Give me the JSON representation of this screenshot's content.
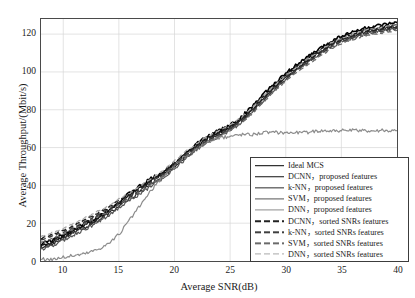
{
  "chart_data": {
    "type": "line",
    "title": "",
    "xlabel": "Average SNR(dB)",
    "ylabel": "Average Throughput/(Mbit/s)",
    "xlim": [
      8,
      40
    ],
    "ylim": [
      0,
      128
    ],
    "xticks": [
      10,
      15,
      20,
      25,
      30,
      35,
      40
    ],
    "yticks": [
      0,
      20,
      40,
      60,
      80,
      100,
      120
    ],
    "grid": true,
    "legend_position": "lower-right",
    "series": [
      {
        "name": "Ideal MCS",
        "style": "solid",
        "color": "#000000",
        "width": 1.6,
        "x": [
          8,
          9,
          10,
          11,
          12,
          13,
          14,
          15,
          16,
          17,
          18,
          19,
          20,
          21,
          22,
          23,
          24,
          25,
          26,
          27,
          28,
          29,
          30,
          31,
          32,
          33,
          34,
          35,
          36,
          37,
          38,
          39,
          40
        ],
        "values": [
          9,
          11,
          14,
          17,
          20,
          23,
          27,
          31,
          36,
          40,
          44,
          47,
          52,
          57,
          62,
          66,
          69,
          72,
          76,
          82,
          88,
          94,
          99,
          104,
          108,
          112,
          116,
          119,
          121,
          123,
          124,
          125,
          126
        ]
      },
      {
        "name": "DCNN，proposed features",
        "style": "solid",
        "color": "#111111",
        "width": 1.5,
        "x": [
          8,
          9,
          10,
          11,
          12,
          13,
          14,
          15,
          16,
          17,
          18,
          19,
          20,
          21,
          22,
          23,
          24,
          25,
          26,
          27,
          28,
          29,
          30,
          31,
          32,
          33,
          34,
          35,
          36,
          37,
          38,
          39,
          40
        ],
        "values": [
          8,
          10,
          13,
          16,
          19,
          22,
          26,
          30,
          35,
          39,
          43,
          46,
          51,
          56,
          61,
          65,
          68,
          71,
          75,
          81,
          87,
          93,
          98,
          103,
          107,
          111,
          115,
          118,
          120,
          122,
          123,
          124,
          125
        ]
      },
      {
        "name": "k-NN，proposed features",
        "style": "solid",
        "color": "#2b2b2b",
        "width": 1.3,
        "x": [
          8,
          9,
          10,
          11,
          12,
          13,
          14,
          15,
          16,
          17,
          18,
          19,
          20,
          21,
          22,
          23,
          24,
          25,
          26,
          27,
          28,
          29,
          30,
          31,
          32,
          33,
          34,
          35,
          36,
          37,
          38,
          39,
          40
        ],
        "values": [
          7,
          9,
          12,
          15,
          18,
          21,
          25,
          29,
          33,
          37,
          41,
          45,
          50,
          55,
          60,
          64,
          67,
          70,
          74,
          80,
          86,
          92,
          97,
          102,
          106,
          110,
          114,
          117,
          119,
          121,
          122,
          123,
          124
        ]
      },
      {
        "name": "SVM，proposed features",
        "style": "solid",
        "color": "#555555",
        "width": 1.2,
        "x": [
          8,
          9,
          10,
          11,
          12,
          13,
          14,
          15,
          16,
          17,
          18,
          19,
          20,
          21,
          22,
          23,
          24,
          25,
          26,
          27,
          28,
          29,
          30,
          31,
          32,
          33,
          34,
          35,
          36,
          37,
          38,
          39,
          40
        ],
        "values": [
          6,
          8,
          11,
          14,
          17,
          20,
          24,
          28,
          32,
          36,
          40,
          44,
          49,
          54,
          59,
          63,
          66,
          69,
          73,
          79,
          85,
          91,
          96,
          101,
          105,
          109,
          113,
          116,
          118,
          120,
          121,
          122,
          123
        ]
      },
      {
        "name": "DNN，proposed features",
        "style": "solid",
        "color": "#8c8c8c",
        "width": 1.2,
        "x": [
          8,
          9,
          10,
          11,
          12,
          13,
          14,
          15,
          16,
          17,
          18,
          19,
          20,
          21,
          22,
          23,
          24,
          25,
          26,
          27,
          28,
          29,
          30,
          31,
          32,
          33,
          34,
          35,
          36,
          37,
          38,
          39,
          40
        ],
        "values": [
          1,
          1,
          2,
          3,
          4,
          6,
          9,
          14,
          22,
          30,
          38,
          45,
          51,
          56,
          60,
          63,
          65,
          66,
          67,
          67,
          68,
          68,
          68,
          68,
          68,
          69,
          69,
          69,
          69,
          69,
          69,
          69,
          69
        ]
      },
      {
        "name": "DCNN，sorted SNRs features",
        "style": "dashed",
        "color": "#222222",
        "width": 1.5,
        "x": [
          8,
          9,
          10,
          11,
          12,
          13,
          14,
          15,
          16,
          17,
          18,
          19,
          20,
          21,
          22,
          23,
          24,
          25,
          26,
          27,
          28,
          29,
          30,
          31,
          32,
          33,
          34,
          35,
          36,
          37,
          38,
          39,
          40
        ],
        "values": [
          12,
          14,
          16,
          19,
          22,
          25,
          28,
          32,
          35,
          39,
          43,
          47,
          52,
          57,
          61,
          65,
          68,
          71,
          75,
          80,
          86,
          92,
          97,
          102,
          106,
          110,
          114,
          117,
          119,
          121,
          122,
          123,
          124
        ]
      },
      {
        "name": "k-NN，sorted SNRs features",
        "style": "dashed",
        "color": "#3f3f3f",
        "width": 1.4,
        "x": [
          8,
          9,
          10,
          11,
          12,
          13,
          14,
          15,
          16,
          17,
          18,
          19,
          20,
          21,
          22,
          23,
          24,
          25,
          26,
          27,
          28,
          29,
          30,
          31,
          32,
          33,
          34,
          35,
          36,
          37,
          38,
          39,
          40
        ],
        "values": [
          11,
          13,
          15,
          18,
          21,
          24,
          27,
          31,
          34,
          38,
          42,
          46,
          51,
          56,
          60,
          64,
          67,
          70,
          74,
          79,
          85,
          91,
          96,
          101,
          105,
          109,
          113,
          116,
          118,
          120,
          121,
          122,
          123
        ]
      },
      {
        "name": "SVM，sorted SNRs features",
        "style": "dashed",
        "color": "#6a6a6a",
        "width": 1.3,
        "x": [
          8,
          9,
          10,
          11,
          12,
          13,
          14,
          15,
          16,
          17,
          18,
          19,
          20,
          21,
          22,
          23,
          24,
          25,
          26,
          27,
          28,
          29,
          30,
          31,
          32,
          33,
          34,
          35,
          36,
          37,
          38,
          39,
          40
        ],
        "values": [
          10,
          12,
          14,
          17,
          20,
          23,
          26,
          30,
          33,
          37,
          41,
          45,
          50,
          55,
          59,
          63,
          66,
          69,
          73,
          78,
          84,
          90,
          95,
          100,
          104,
          108,
          112,
          115,
          117,
          119,
          120,
          121,
          122
        ]
      },
      {
        "name": "DNN，sorted SNRs features",
        "style": "dashed",
        "color": "#a8a8a8",
        "width": 1.2,
        "x": [
          8,
          9,
          10,
          11,
          12,
          13,
          14,
          15,
          16,
          17,
          18,
          19,
          20,
          21,
          22,
          23,
          24,
          25,
          26,
          27,
          28,
          29,
          30,
          31,
          32,
          33,
          34,
          35,
          36,
          37,
          38,
          39,
          40
        ],
        "values": [
          13,
          15,
          17,
          20,
          23,
          26,
          29,
          33,
          36,
          40,
          44,
          48,
          53,
          58,
          62,
          66,
          69,
          72,
          76,
          81,
          87,
          93,
          98,
          103,
          107,
          111,
          115,
          118,
          120,
          122,
          123,
          124,
          125
        ]
      }
    ]
  }
}
